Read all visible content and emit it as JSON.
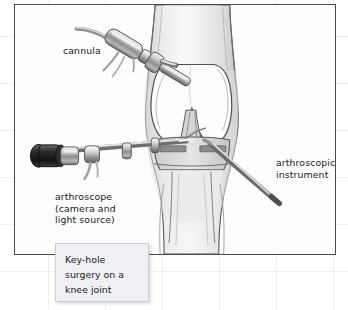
{
  "figure": {
    "title": "Key-hole surgery on a knee joint",
    "border_color": "#4a4a4a",
    "background_color": "#fdfdfd",
    "paper_grid_color": "#96a0b9"
  },
  "labels": {
    "cannula": "cannula",
    "arthroscope": "arthroscope\n(camera and\nlight source)",
    "arthroscopic_instrument": "arthroscopic\ninstrument"
  },
  "caption": {
    "text": "Key-hole\nsurgery on a\nknee joint",
    "fill_color": "#eef0f3",
    "border_color": "#c9ccd2"
  },
  "illustration": {
    "subject": "anterior view of a knee joint undergoing arthroscopy",
    "parts": [
      "thigh",
      "femoral condyles",
      "cruciate ligaments",
      "menisci",
      "tibia",
      "lower leg"
    ],
    "instruments": [
      "cannula",
      "arthroscope",
      "arthroscopic instrument"
    ],
    "style": "grayscale pencil and wash medical drawing"
  }
}
